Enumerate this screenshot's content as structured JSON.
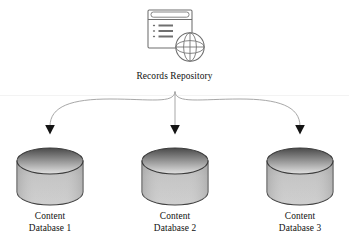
{
  "diagram": {
    "type": "architecture-flow",
    "background_color": "#ffffff",
    "width": 349,
    "height": 249,
    "source": {
      "label": "Records Repository",
      "icon": "browser-window-globe-icon",
      "center_x": 175,
      "center_y": 38,
      "icon_stroke_color": "#6f6f6f"
    },
    "divider": {
      "name": "horizontal-rule",
      "y": 95,
      "color": "#f2f2f2"
    },
    "connectors": {
      "name": "branching-arrows",
      "origin_x": 175,
      "origin_y": 92,
      "arrow_y": 133,
      "line_color": "#9a9a9a",
      "arrowhead_color": "#141414",
      "targets_x": [
        50,
        175,
        300
      ]
    },
    "nodes": [
      {
        "id": "content-database-1",
        "shape": "cylinder",
        "center_x": 50,
        "label_line_1": "Content",
        "label_line_2": "Database 1"
      },
      {
        "id": "content-database-2",
        "shape": "cylinder",
        "center_x": 175,
        "label_line_1": "Content",
        "label_line_2": "Database 2"
      },
      {
        "id": "content-database-3",
        "shape": "cylinder",
        "center_x": 300,
        "label_line_1": "Content",
        "label_line_2": "Database 3"
      }
    ],
    "cylinder_style": {
      "top_y": 148,
      "bottom_y": 205,
      "half_width": 33,
      "ellipse_ry": 13,
      "outline_color": "#3b3b3b",
      "gradient_dark": "#4d4d4d",
      "gradient_mid": "#9c9c9c",
      "gradient_light": "#d8d8d8",
      "body_gradient_top": "#b9b9b9",
      "body_gradient_bottom": "#c9c9c9"
    }
  }
}
